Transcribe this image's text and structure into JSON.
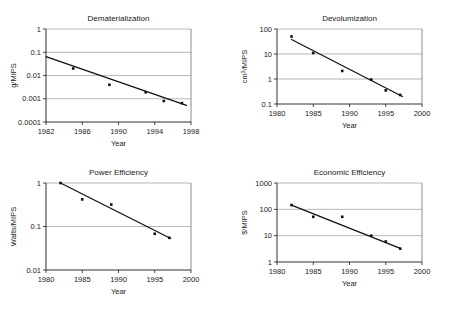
{
  "figure": {
    "background_color": "#ffffff",
    "line_color": "#111111",
    "grid_color": "#9a9a9a",
    "panel_count": 4
  },
  "chart_data": [
    {
      "type": "scatter",
      "title": "Dematerialization",
      "xlabel": "Year",
      "ylabel": "g/MIPS",
      "yscale": "log",
      "xlim": [
        1982,
        1998
      ],
      "ylim": [
        0.0001,
        1
      ],
      "xticks": [
        1982,
        1986,
        1990,
        1994,
        1998
      ],
      "xticklabels": [
        "1982",
        "1986",
        "1990",
        "1994",
        "1998"
      ],
      "yticks": [
        0.0001,
        0.001,
        0.01,
        0.1,
        1
      ],
      "yticklabels": [
        "0.0001",
        "0.001",
        "0.01",
        "0.1",
        "1"
      ],
      "grid": true,
      "legend": "none",
      "x": [
        1985,
        1989,
        1993,
        1995,
        1997
      ],
      "values": [
        0.02,
        0.004,
        0.0019,
        0.0008,
        0.00065
      ],
      "trend_line": {
        "x": [
          1982,
          1997.5
        ],
        "y": [
          0.065,
          0.00052
        ]
      }
    },
    {
      "type": "scatter",
      "title": "Devolumization",
      "xlabel": "Year",
      "ylabel": "cm3/MIPS",
      "ylabel_base": "cm",
      "ylabel_sup": "3",
      "ylabel_rest": "/MIPS",
      "yscale": "log",
      "xlim": [
        1980,
        2000
      ],
      "ylim": [
        0.1,
        100
      ],
      "xticks": [
        1980,
        1985,
        1990,
        1995,
        2000
      ],
      "xticklabels": [
        "1980",
        "1985",
        "1990",
        "1995",
        "2000"
      ],
      "yticks": [
        0.1,
        1,
        10,
        100
      ],
      "yticklabels": [
        "0.1",
        "1",
        "10",
        "100"
      ],
      "grid": true,
      "legend": "none",
      "x": [
        1982,
        1985,
        1989,
        1993,
        1995,
        1997
      ],
      "values": [
        50,
        11,
        2.1,
        0.95,
        0.35,
        0.23
      ],
      "trend_line": {
        "x": [
          1982,
          1997.3
        ],
        "y": [
          38,
          0.2
        ]
      }
    },
    {
      "type": "scatter",
      "title": "Power Efficiency",
      "xlabel": "Year",
      "ylabel": "Watts/MIPS",
      "yscale": "log",
      "xlim": [
        1980,
        2000
      ],
      "ylim": [
        0.01,
        1
      ],
      "xticks": [
        1980,
        1985,
        1990,
        1995,
        2000
      ],
      "xticklabels": [
        "1980",
        "1985",
        "1990",
        "1995",
        "2000"
      ],
      "yticks": [
        0.01,
        0.1,
        1
      ],
      "yticklabels": [
        "0.01",
        "0.1",
        "1"
      ],
      "grid": true,
      "legend": "none",
      "x": [
        1982,
        1985,
        1989,
        1995,
        1997
      ],
      "values": [
        1.0,
        0.42,
        0.32,
        0.068,
        0.055
      ],
      "trend_line": {
        "x": [
          1982,
          1997.2
        ],
        "y": [
          1.0,
          0.053
        ]
      }
    },
    {
      "type": "scatter",
      "title": "Economic Efficiency",
      "xlabel": "Year",
      "ylabel": "$/MIPS",
      "yscale": "log",
      "xlim": [
        1980,
        2000
      ],
      "ylim": [
        1,
        1000
      ],
      "xticks": [
        1980,
        1985,
        1990,
        1995,
        2000
      ],
      "xticklabels": [
        "1980",
        "1985",
        "1990",
        "1995",
        "2000"
      ],
      "yticks": [
        1,
        10,
        100,
        1000
      ],
      "yticklabels": [
        "1",
        "10",
        "100",
        "1000"
      ],
      "grid": true,
      "legend": "none",
      "x": [
        1982,
        1985,
        1989,
        1993,
        1995,
        1997
      ],
      "values": [
        145,
        52,
        52,
        10,
        6,
        3.2
      ],
      "trend_line": {
        "x": [
          1982,
          1997
        ],
        "y": [
          145,
          3.3
        ]
      }
    }
  ]
}
